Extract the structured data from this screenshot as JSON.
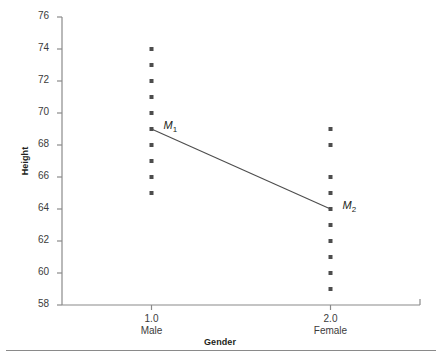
{
  "chart_data": {
    "type": "scatter",
    "title": "",
    "xlabel": "Gender",
    "ylabel": "Height",
    "ylim": [
      58,
      76
    ],
    "yticks": [
      58,
      60,
      62,
      64,
      66,
      68,
      70,
      72,
      74,
      76
    ],
    "xlim": [
      0.5,
      2.5
    ],
    "xticks": [
      1.0,
      2.0
    ],
    "xtick_labels": [
      "1.0",
      "2.0"
    ],
    "xtick_sublabels": [
      "Male",
      "Female"
    ],
    "grid": false,
    "legend": false,
    "marker_color": "#4d4d4d",
    "line_color": "#4d4d4d",
    "axis_color": "#8a8a8a",
    "series": [
      {
        "name": "Male",
        "x": 1.0,
        "values": [
          74,
          73,
          72,
          71,
          70,
          69,
          68,
          67,
          66,
          65
        ]
      },
      {
        "name": "Female",
        "x": 2.0,
        "values": [
          69,
          68,
          66,
          65,
          64,
          63,
          62,
          61,
          60,
          59
        ]
      }
    ],
    "means": [
      {
        "label": "M",
        "subscript": "1",
        "x": 1.0,
        "y": 69
      },
      {
        "label": "M",
        "subscript": "2",
        "x": 2.0,
        "y": 64
      }
    ],
    "mean_line": {
      "x1": 1.0,
      "y1": 69,
      "x2": 2.0,
      "y2": 64
    }
  }
}
